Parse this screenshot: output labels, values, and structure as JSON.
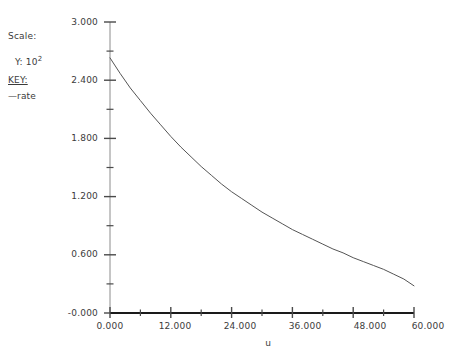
{
  "annotations": {
    "scale_label": "Scale:",
    "y_units_prefix": "Y: 10",
    "y_units_exponent": "2",
    "key_title": "KEY:",
    "series_marker": "—",
    "series_name": "rate"
  },
  "chart_data": {
    "type": "line",
    "title": "",
    "xlabel": "u",
    "ylabel": "",
    "y_scale_note": "Y: 10^2",
    "xlim": [
      0.0,
      60.0
    ],
    "ylim": [
      0.0,
      3.0
    ],
    "grid": false,
    "legend_position": "left-outside",
    "x_ticks": [
      0.0,
      12.0,
      24.0,
      36.0,
      48.0,
      60.0
    ],
    "x_tick_labels": [
      "0.000",
      "12.000",
      "24.000",
      "36.000",
      "48.000",
      "60.000"
    ],
    "x_minor_ticks": [
      6.0,
      18.0,
      30.0,
      42.0,
      54.0
    ],
    "y_ticks": [
      0.0,
      0.6,
      1.2,
      1.8,
      2.4,
      3.0
    ],
    "y_tick_labels": [
      "-0.000",
      "0.600",
      "1.200",
      "1.800",
      "2.400",
      "3.000"
    ],
    "y_minor_ticks": [
      0.3,
      0.9,
      1.5,
      2.1,
      2.7
    ],
    "series": [
      {
        "name": "rate",
        "color": "#555555",
        "x": [
          0.0,
          2.0,
          4.0,
          6.0,
          8.0,
          10.0,
          12.0,
          14.0,
          16.0,
          18.0,
          20.0,
          22.0,
          24.0,
          26.0,
          28.0,
          30.0,
          32.0,
          34.0,
          36.0,
          38.0,
          40.0,
          42.0,
          44.0,
          46.0,
          48.0,
          50.0,
          52.0,
          54.0,
          56.0,
          58.0,
          60.0
        ],
        "y": [
          2.63,
          2.47,
          2.32,
          2.19,
          2.06,
          1.94,
          1.82,
          1.71,
          1.61,
          1.51,
          1.42,
          1.33,
          1.25,
          1.18,
          1.11,
          1.04,
          0.98,
          0.92,
          0.86,
          0.81,
          0.76,
          0.71,
          0.66,
          0.62,
          0.57,
          0.53,
          0.49,
          0.45,
          0.4,
          0.35,
          0.28
        ]
      }
    ]
  },
  "axis_tick_labels": {
    "y": [
      {
        "text": "3.000",
        "top": 17
      },
      {
        "text": "2.400",
        "top": 75
      },
      {
        "text": "1.800",
        "top": 133
      },
      {
        "text": "1.200",
        "top": 191
      },
      {
        "text": "0.600",
        "top": 249
      },
      {
        "text": "-0.000",
        "top": 308
      }
    ],
    "x": [
      {
        "text": "0.000",
        "left": 82
      },
      {
        "text": "12.000",
        "left": 147
      },
      {
        "text": "24.000",
        "left": 212
      },
      {
        "text": "36.000",
        "left": 277
      },
      {
        "text": "48.000",
        "left": 342
      },
      {
        "text": "60.000",
        "left": 407
      }
    ]
  },
  "colors": {
    "curve": "#5a5a5a",
    "y_axis": "#8c8c8c",
    "x_axis": "#1a1a1a",
    "tick": "#4a4a4a",
    "text": "#3b3b3b",
    "background": "#ffffff"
  }
}
